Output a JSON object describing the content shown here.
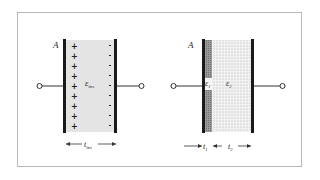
{
  "diagram": {
    "left_capacitor": {
      "plate_label": "A",
      "dielectric_label": "ε",
      "dielectric_subscript": "ins",
      "thickness_label": "t",
      "thickness_subscript": "ins",
      "plus_count": 9,
      "minus_count": 9,
      "plus_symbol": "+",
      "minus_symbol": "-"
    },
    "right_capacitor": {
      "plate_label": "A",
      "layer1_label": "ε",
      "layer1_subscript": "1",
      "layer2_label": "ε",
      "layer2_subscript": "2",
      "thickness1_label": "t",
      "thickness1_subscript": "1",
      "thickness2_label": "t",
      "thickness2_subscript": "2"
    },
    "colors": {
      "plate": "#1a1a1a",
      "dielectric_fill": "#e6e6e6",
      "layer1_fill": "#8a8a8a",
      "layer2_dots": "#b0b0b0",
      "frame_border": "#b8b8b8",
      "wire": "#333333"
    }
  }
}
